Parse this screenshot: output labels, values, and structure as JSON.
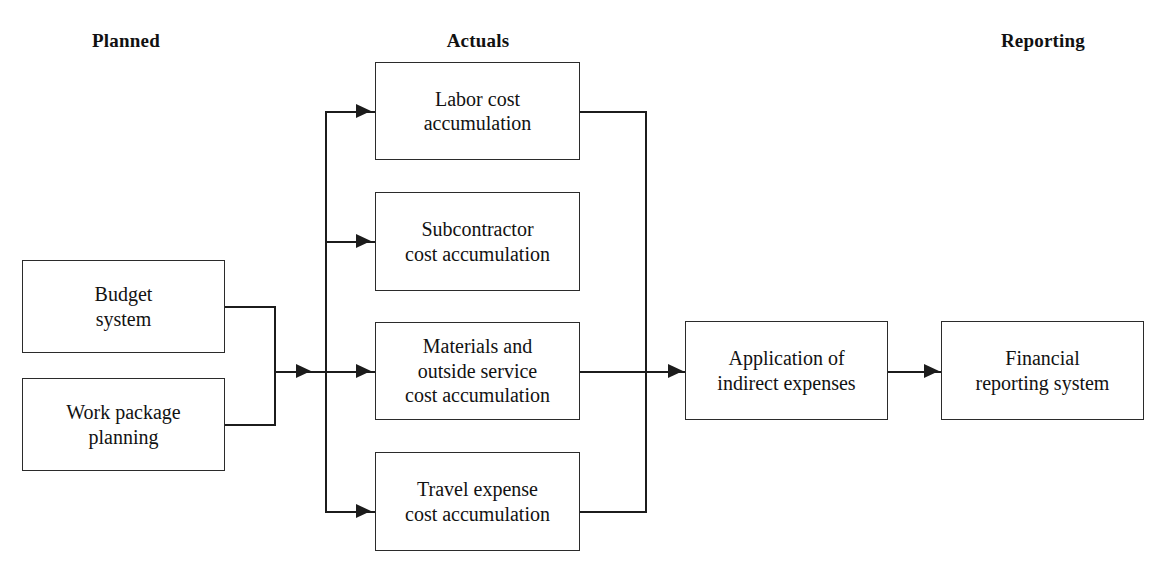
{
  "diagram": {
    "background_color": "#ffffff",
    "line_color": "#1c1c1c",
    "box_border_color": "#2b2b2b",
    "text_color": "#121212"
  },
  "headings": [
    {
      "id": "planned",
      "label": "Planned"
    },
    {
      "id": "actuals",
      "label": "Actuals"
    },
    {
      "id": "reporting",
      "label": "Reporting"
    }
  ],
  "nodes": {
    "budget_system": {
      "label": "Budget\nsystem"
    },
    "work_package": {
      "label": "Work package\nplanning"
    },
    "labor": {
      "label": "Labor cost\naccumulation"
    },
    "subcontractor": {
      "label": "Subcontractor\ncost accumulation"
    },
    "materials": {
      "label": "Materials and\noutside service\ncost accumulation"
    },
    "travel": {
      "label": "Travel expense\ncost accumulation"
    },
    "indirect": {
      "label": "Application of\nindirect expenses"
    },
    "financial": {
      "label": "Financial\nreporting system"
    }
  }
}
